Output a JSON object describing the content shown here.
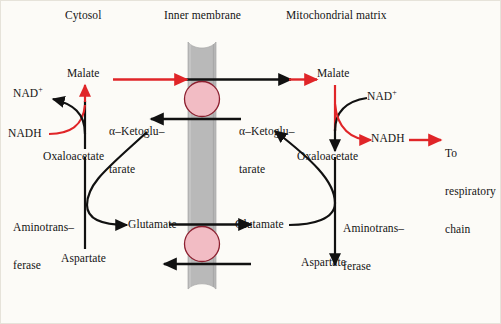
{
  "diagram": {
    "type": "biochemical-pathway",
    "background_color": "#fcfbf7",
    "membrane_color": "#b9b9b9",
    "transporter_color": "#f2bcc4",
    "flow_color": "#e02528",
    "enzyme_color": "#111111"
  },
  "compartments": {
    "cytosol": "Cytosol",
    "membrane": "Inner membrane",
    "matrix": "Mitochondrial matrix"
  },
  "cytosol": {
    "malate": "Malate",
    "nad_plus": "NAD",
    "nad_plus_charge": "+",
    "nadh": "NADH",
    "oxaloacetate": "Oxaloacetate",
    "ketoglutarate_line1": "α–Ketoglu–",
    "ketoglutarate_line2": "tarate",
    "aminotransferase_line1": "Aminotrans–",
    "aminotransferase_line2": "ferase",
    "glutamate": "Glutamate",
    "aspartate": "Aspartate"
  },
  "matrix": {
    "malate": "Malate",
    "nad_plus": "NAD",
    "nad_plus_charge": "+",
    "nadh": "NADH",
    "oxaloacetate": "Oxaloacetate",
    "ketoglutarate_line1": "α–Ketoglu–",
    "ketoglutarate_line2": "tarate",
    "aminotransferase_line1": "Aminotrans–",
    "aminotransferase_line2": "ferase",
    "glutamate": "Glutamate",
    "aspartate": "Aspartate"
  },
  "output": {
    "line1": "To",
    "line2": "respiratory",
    "line3": "chain"
  }
}
